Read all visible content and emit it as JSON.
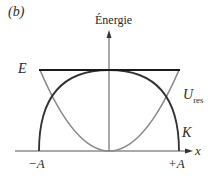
{
  "panel_label": "(b)",
  "axes": {
    "y_label": "Énergie",
    "x_label": "x",
    "x_ticks": [
      "−A",
      "+A"
    ]
  },
  "curves": {
    "total_energy": {
      "label": "E",
      "color": "#1a1a1a"
    },
    "potential": {
      "label": "U",
      "subscript": "res",
      "color": "#8a8a8a"
    },
    "kinetic": {
      "label": "K",
      "color": "#333333"
    }
  }
}
